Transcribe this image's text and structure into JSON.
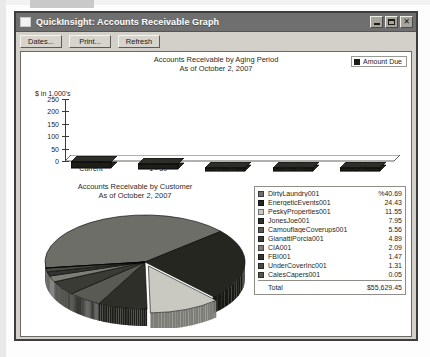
{
  "window": {
    "title": "QuickInsight: Accounts Receivable Graph",
    "icon": "window-icon",
    "minimize_label": "Minimize",
    "maximize_label": "Maximize",
    "close_label": "Close",
    "close_glyph": "✕"
  },
  "toolbar": {
    "buttons": [
      {
        "label": "Dates...",
        "name": "dates-button"
      },
      {
        "label": "Print...",
        "name": "print-button"
      },
      {
        "label": "Refresh",
        "name": "refresh-button"
      }
    ]
  },
  "bar_chart": {
    "title_line1": "Accounts Receivable by Aging Period",
    "title_line2": "As of October 2, 2007",
    "legend_label": "Amount Due",
    "axis_unit": "$ in 1,000's"
  },
  "pie_chart": {
    "title_line1": "Accounts Receivable by Customer",
    "title_line2": "As of October 2, 2007",
    "total_label": "Total",
    "total_value": "$55,629.45"
  },
  "chart_data": [
    {
      "type": "bar",
      "title": "Accounts Receivable by Aging Period",
      "subtitle": "As of October 2, 2007",
      "categories": [
        "Current",
        "1 - 30",
        "31 - 60",
        "61 - 90",
        "> 90"
      ],
      "values": [
        24,
        20,
        12,
        11,
        7
      ],
      "series": [
        {
          "name": "Amount Due",
          "values": [
            24,
            20,
            12,
            11,
            7
          ]
        }
      ],
      "xlabel": "",
      "ylabel": "$ in 1,000's",
      "ylim": [
        0,
        250
      ],
      "yticks": [
        0,
        50,
        100,
        150,
        200,
        250
      ],
      "ytick_labels": [
        "0",
        "50",
        "100",
        "150",
        "200",
        "250"
      ],
      "grid": false,
      "legend_position": "top-right"
    },
    {
      "type": "pie",
      "title": "Accounts Receivable by Customer",
      "subtitle": "As of October 2, 2007",
      "value_unit": "percent",
      "legend_position": "right",
      "total_label": "Total",
      "total_value": "$55,629.45",
      "slices": [
        {
          "label": "DirtyLaundry001",
          "value": 40.69,
          "display": "%40.69",
          "color": "#6e6e68"
        },
        {
          "label": "EnergeticEvents001",
          "value": 24.43,
          "display": "24.43",
          "color": "#262621"
        },
        {
          "label": "PeskyProperties001",
          "value": 11.55,
          "display": "11.55",
          "color": "#c9c9c2"
        },
        {
          "label": "JonesJoe001",
          "value": 7.95,
          "display": "7.95",
          "color": "#2f2f2a"
        },
        {
          "label": "CamouflageCoverups001",
          "value": 5.56,
          "display": "5.56",
          "color": "#5a5a54"
        },
        {
          "label": "GianattiPorcia001",
          "value": 4.89,
          "display": "4.89",
          "color": "#3b3b35"
        },
        {
          "label": "CIA001",
          "value": 2.09,
          "display": "2.09",
          "color": "#7e7e77"
        },
        {
          "label": "FBI001",
          "value": 1.47,
          "display": "1.47",
          "color": "#343430"
        },
        {
          "label": "UnderCoverInc001",
          "value": 1.31,
          "display": "1.31",
          "color": "#4a4a44"
        },
        {
          "label": "CalesCapers001",
          "value": 0.05,
          "display": "0.05",
          "color": "#58584f"
        }
      ]
    }
  ]
}
